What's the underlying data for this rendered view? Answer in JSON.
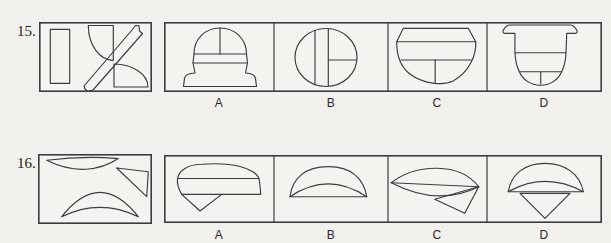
{
  "document": {
    "background": "#f1f0ec",
    "ink": "#3c3c3c",
    "questions": [
      {
        "number": "15.",
        "pieces": [
          "vertical-rectangle",
          "quarter-disc-top",
          "diagonal-strip-notched",
          "quarter-disc-bottom"
        ],
        "options": [
          {
            "label": "A",
            "shape": "dome-with-banded-stepped-base"
          },
          {
            "label": "B",
            "shape": "oval-with-two-vertical-chords-and-right-horizontal"
          },
          {
            "label": "C",
            "shape": "flat-top-bowl-with-cross-lines"
          },
          {
            "label": "D",
            "shape": "flared-rim-jar-with-cross-lines"
          }
        ]
      },
      {
        "number": "16.",
        "pieces": [
          "thin-curved-blade",
          "right-triangle",
          "crescent"
        ],
        "options": [
          {
            "label": "A",
            "shape": "cap-with-band-and-down-triangle"
          },
          {
            "label": "B",
            "shape": "dome-with-inner-arc"
          },
          {
            "label": "C",
            "shape": "pointed-lens-with-chord-and-triangle"
          },
          {
            "label": "D",
            "shape": "dome-with-inner-arc-and-down-triangle"
          }
        ]
      }
    ]
  }
}
